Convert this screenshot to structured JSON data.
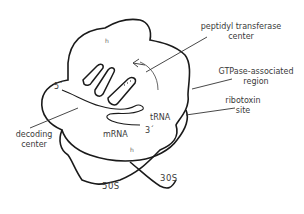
{
  "diagram": {
    "labels": {
      "peptidyl_transferase_line1": "peptidyl transferase",
      "peptidyl_transferase_line2": "center",
      "gtpase_line1": "GTPase-associated",
      "gtpase_line2": "region",
      "ribotoxin_line1": "ribotoxin",
      "ribotoxin_line2": "site",
      "decoding_line1": "decoding",
      "decoding_line2": "center",
      "trna": "tRNA",
      "mrna": "mRNA",
      "five_prime": "5´",
      "three_prime": "3´",
      "subunit_large": "50S",
      "subunit_small": "30S",
      "marker_top": "h",
      "marker_bottom": "h"
    },
    "colors": {
      "outline": "#1a1a1a",
      "leader_line": "#333333",
      "text": "#3a3a3a"
    }
  }
}
